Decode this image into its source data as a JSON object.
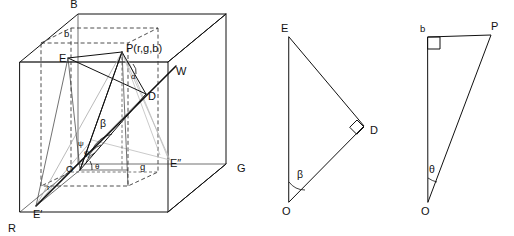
{
  "figure": {
    "background_color": "#ffffff",
    "line_color": "#111111",
    "dashed_color": "#3a3a3a",
    "gray_color": "#a8a8a8"
  },
  "cube_panel": {
    "name": "rgb-colour-cube",
    "point_label": "P(r,g,b)",
    "vertices": [
      {
        "key": "B",
        "label": "B",
        "x": 74,
        "y": 8
      },
      {
        "key": "b",
        "label": "b",
        "x": 69,
        "y": 34
      },
      {
        "key": "E",
        "label": "E",
        "x": 66,
        "y": 58
      },
      {
        "key": "W",
        "label": "W",
        "x": 176,
        "y": 71
      },
      {
        "key": "D",
        "label": "D",
        "x": 148,
        "y": 96
      },
      {
        "key": "G",
        "label": "G",
        "x": 237,
        "y": 168
      },
      {
        "key": "g",
        "label": "g",
        "x": 143,
        "y": 166
      },
      {
        "key": "E2",
        "label": "E″",
        "x": 175,
        "y": 163
      },
      {
        "key": "O",
        "label": "O",
        "x": 70,
        "y": 166
      },
      {
        "key": "r",
        "label": "r",
        "x": 49,
        "y": 186
      },
      {
        "key": "E1",
        "label": "E′",
        "x": 36,
        "y": 214
      },
      {
        "key": "R",
        "label": "R",
        "x": 10,
        "y": 228
      }
    ],
    "angles": [
      {
        "key": "beta",
        "label": "β",
        "x": 100,
        "y": 127
      },
      {
        "key": "theta",
        "label": "θ",
        "x": 95,
        "y": 166
      },
      {
        "key": "alpha",
        "label": "α",
        "x": 130,
        "y": 76
      },
      {
        "key": "phi",
        "label": "φ",
        "x": 84,
        "y": 152
      },
      {
        "key": "psi",
        "label": "ψ",
        "x": 80,
        "y": 144
      }
    ]
  },
  "triangle_beta": {
    "name": "auxiliary-triangle-beta",
    "vertices": [
      {
        "key": "E",
        "label": "E",
        "x": 286,
        "y": 30
      },
      {
        "key": "D",
        "label": "D",
        "x": 364,
        "y": 131
      },
      {
        "key": "O",
        "label": "O",
        "x": 287,
        "y": 207
      }
    ],
    "angle_label": "β",
    "angle_x": 301,
    "angle_y": 175,
    "right_angle_at": "D"
  },
  "triangle_theta": {
    "name": "auxiliary-triangle-theta",
    "vertices": [
      {
        "key": "b",
        "label": "b",
        "x": 422,
        "y": 30
      },
      {
        "key": "P",
        "label": "P",
        "x": 489,
        "y": 30
      },
      {
        "key": "O",
        "label": "O",
        "x": 426,
        "y": 207
      }
    ],
    "angle_label": "θ",
    "angle_x": 433,
    "angle_y": 170,
    "right_angle_at": "b"
  }
}
